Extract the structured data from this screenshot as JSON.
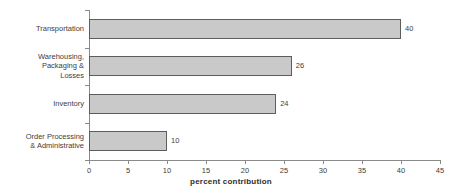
{
  "chart_data": {
    "type": "bar",
    "orientation": "horizontal",
    "title": "",
    "xlabel": "percent contribution",
    "ylabel": "",
    "categories": [
      "Transportation",
      "Warehousing, Packaging & Losses",
      "Inventory",
      "Order Processing & Administrative"
    ],
    "category_lines": [
      [
        "Transportation"
      ],
      [
        "Warehousing,",
        "Packaging &",
        "Losses"
      ],
      [
        "Inventory"
      ],
      [
        "Order Processing",
        "& Administrative"
      ]
    ],
    "values": [
      40,
      26,
      24,
      10
    ],
    "value_labels": [
      "40",
      "26",
      "24",
      "10"
    ],
    "xlim": [
      0,
      45
    ],
    "xticks": [
      0,
      5,
      10,
      15,
      20,
      25,
      30,
      35,
      40,
      45
    ],
    "xtick_labels": [
      "0",
      "5",
      "10",
      "15",
      "20",
      "25",
      "30",
      "35",
      "40",
      "45"
    ],
    "grid": false,
    "legend": false,
    "colors": {
      "bar_fill": "#c9c9c9",
      "bar_border": "#5d5d5d",
      "axis": "#8a8a8a",
      "text": "#3d3d3d",
      "background": "#ffffff"
    }
  }
}
